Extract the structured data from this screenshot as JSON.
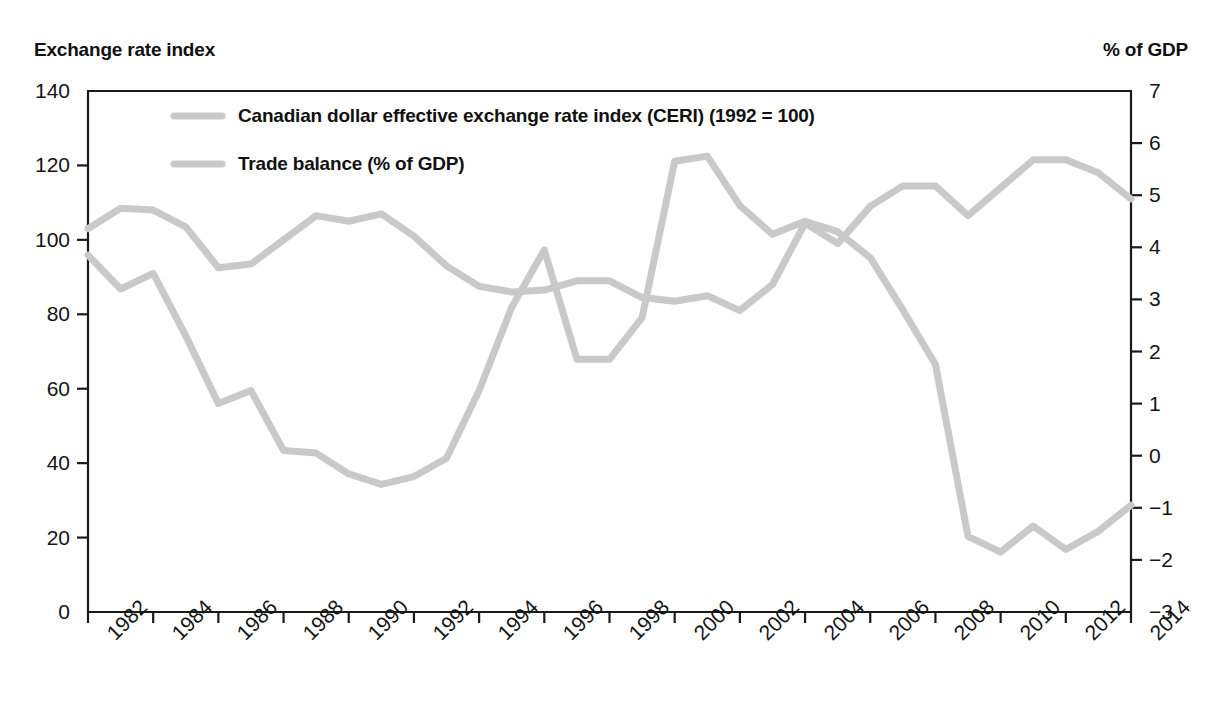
{
  "axis_titles": {
    "left": "Exchange rate index",
    "right": "% of GDP"
  },
  "legend": {
    "items": [
      {
        "label": "Canadian dollar effective exchange rate index (CERI) (1992 = 100)",
        "color": "#c9c9c9"
      },
      {
        "label": "Trade balance (% of GDP)",
        "color": "#c9c9c9"
      }
    ]
  },
  "chart_data": {
    "type": "line",
    "title": "",
    "subtitle": "",
    "xlabel": "",
    "ylabel": "Exchange rate index",
    "y2label": "% of GDP",
    "grid": false,
    "legend_position": "top-left-inside",
    "xlim": [
      1982,
      2014
    ],
    "ylim": [
      0,
      140
    ],
    "y2lim": [
      -3,
      7
    ],
    "yticks": [
      0,
      20,
      40,
      60,
      80,
      100,
      120,
      140
    ],
    "y2ticks": [
      -3,
      -2,
      -1,
      0,
      1,
      2,
      3,
      4,
      5,
      6,
      7
    ],
    "xticks": [
      1982,
      1984,
      1986,
      1988,
      1990,
      1992,
      1994,
      1996,
      1998,
      2000,
      2002,
      2004,
      2006,
      2008,
      2010,
      2012,
      2014
    ],
    "xtick_labels": [
      "1982",
      "1984",
      "1986",
      "1988",
      "1990",
      "1992",
      "1994",
      "1996",
      "1998",
      "2000",
      "2002",
      "2004",
      "2006",
      "2008",
      "2010",
      "2012",
      "2014"
    ],
    "ytick_labels": [
      "0",
      "20",
      "40",
      "60",
      "80",
      "100",
      "120",
      "140"
    ],
    "y2tick_labels": [
      "−3",
      "−2",
      "−1",
      "0",
      "1",
      "2",
      "3",
      "4",
      "5",
      "6",
      "7"
    ],
    "x": [
      1982,
      1983,
      1984,
      1985,
      1986,
      1987,
      1988,
      1989,
      1990,
      1991,
      1992,
      1993,
      1994,
      1995,
      1996,
      1997,
      1998,
      1999,
      2000,
      2001,
      2002,
      2003,
      2004,
      2005,
      2006,
      2007,
      2008,
      2009,
      2010,
      2011,
      2012,
      2013,
      2014
    ],
    "series": [
      {
        "name": "Canadian dollar effective exchange rate index (CERI) (1992 = 100)",
        "axis": "left",
        "color": "#c9c9c9",
        "values": [
          103,
          108.5,
          108,
          103.5,
          92.5,
          93.5,
          100,
          106.5,
          105,
          107,
          101,
          93,
          87.5,
          86,
          86.5,
          89,
          89,
          84.5,
          83.5,
          85,
          81,
          88,
          104.5,
          99,
          109,
          114.5,
          114.5,
          106.5,
          114,
          121.5,
          121.5,
          118,
          111
        ]
      },
      {
        "name": "Trade balance (% of GDP)",
        "axis": "right",
        "color": "#c9c9c9",
        "values": [
          3.85,
          3.2,
          3.5,
          2.3,
          1.0,
          1.25,
          0.1,
          0.05,
          -0.35,
          -0.55,
          -0.4,
          -0.05,
          1.25,
          2.85,
          3.95,
          1.85,
          1.85,
          2.65,
          5.65,
          5.75,
          4.8,
          4.25,
          4.5,
          4.3,
          3.8,
          2.8,
          1.75,
          -1.55,
          -1.85,
          -1.35,
          -1.8,
          -1.45,
          -0.95
        ]
      }
    ],
    "series_left_scale_equivalent": {
      "trade_balance_on_left_axis": [
        96,
        87,
        91,
        79,
        56,
        59.5,
        43.5,
        42.5,
        34.5,
        34,
        36.5,
        41.5,
        59.5,
        82,
        97,
        69,
        69,
        79,
        121,
        123,
        109,
        101.5,
        105,
        102,
        95.5,
        81.5,
        66.5,
        20.5,
        16,
        23,
        17,
        21.5,
        28.5
      ]
    }
  }
}
